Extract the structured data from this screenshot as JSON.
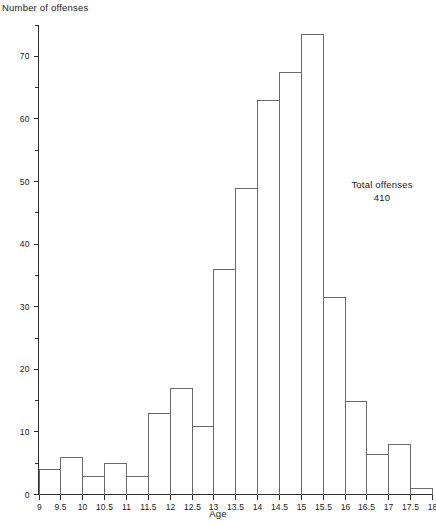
{
  "chart_data": {
    "type": "bar",
    "title": "",
    "xlabel": "Age",
    "ylabel": "Number of offenses",
    "categories": [
      "9-9.5",
      "9.5-10",
      "10-10.5",
      "10.5-11",
      "11-11.5",
      "11.5-12",
      "12-12.5",
      "12.5-13",
      "13-13.5",
      "13.5-14",
      "14-14.5",
      "14.5-15",
      "15-15.5",
      "15.5-16",
      "16-16.5",
      "16.5-17",
      "17-17.5",
      "17.5-18"
    ],
    "bin_edges": [
      9,
      9.5,
      10,
      10.5,
      11,
      11.5,
      12,
      12.5,
      13,
      13.5,
      14,
      14.5,
      15,
      15.5,
      16,
      16.5,
      17,
      17.5,
      18
    ],
    "values": [
      4,
      6,
      3,
      5,
      3,
      13,
      17,
      11,
      36,
      49,
      63,
      67.5,
      73.5,
      31.5,
      15,
      6.5,
      8,
      1
    ],
    "xlim": [
      9,
      18
    ],
    "ylim": [
      0,
      75
    ],
    "x_ticks": [
      "9",
      "9.5",
      "10",
      "10.5",
      "11",
      "11.5",
      "12",
      "12.5",
      "13",
      "13.5",
      "14",
      "14.5",
      "15",
      "15.5",
      "16",
      "16.5",
      "17",
      "17.5",
      "18"
    ],
    "x_tick_values": [
      9,
      9.5,
      10,
      10.5,
      11,
      11.5,
      12,
      12.5,
      13,
      13.5,
      14,
      14.5,
      15,
      15.5,
      16,
      16.5,
      17,
      17.5,
      18
    ],
    "y_major_ticks": [
      0,
      10,
      20,
      30,
      40,
      50,
      60,
      70
    ],
    "y_minor_ticks": [
      5,
      15,
      25,
      35,
      45,
      55,
      65,
      75
    ],
    "y_tick_labels": [
      "0",
      "10",
      "20",
      "30",
      "40",
      "50",
      "60",
      "70"
    ],
    "grid": false,
    "legend": false,
    "annotations": [
      {
        "line1": "Total offenses",
        "line2": "410"
      }
    ]
  },
  "annotation": {
    "line1": "Total offenses",
    "line2": "410"
  },
  "axes": {
    "x_title": "Age",
    "y_title": "Number of offenses"
  },
  "colors": {
    "background": "#ffffff",
    "axis": "#2b2b2b",
    "bar_outline": "#6a6a6a",
    "text": "#1a1a1a"
  }
}
